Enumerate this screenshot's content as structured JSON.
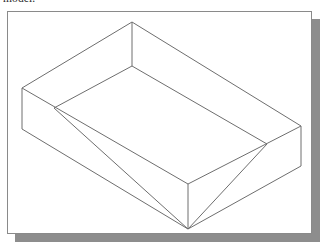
{
  "document": {
    "text_fragment": "model.",
    "background_color": "#ffffff"
  },
  "figure": {
    "name": "isometric-open-box-wireframe",
    "caption": "",
    "frame": {
      "border_color": "#8a8a8a",
      "fill_color": "#ffffff",
      "x": 7,
      "y": 11,
      "width": 305,
      "height": 223
    },
    "shadow": {
      "color": "#8d8d8d",
      "offset_x": 8,
      "offset_y": 8
    },
    "drawing": {
      "type": "isometric-wireframe",
      "subject": "open-top rectangular box (tray)",
      "stroke_color": "#6e6e6e",
      "stroke_width": 1,
      "fill": "none",
      "vertices": {
        "outer_top_back": [
          124,
          10
        ],
        "outer_top_left": [
          14,
          76
        ],
        "outer_top_front": [
          180,
          172
        ],
        "outer_top_right": [
          293,
          114
        ],
        "outer_bottom_left": [
          14,
          117
        ],
        "outer_bottom_front": [
          180,
          217
        ],
        "outer_bottom_right": [
          293,
          154
        ],
        "inner_top_back": [
          124,
          54
        ],
        "inner_rim_left": [
          46,
          96
        ],
        "inner_rim_right": [
          259,
          132
        ]
      },
      "edges": [
        {
          "name": "top-rim-back-left",
          "from": "outer_top_back",
          "to": "outer_top_left"
        },
        {
          "name": "top-rim-back-right",
          "from": "outer_top_back",
          "to": "outer_top_right"
        },
        {
          "name": "top-rim-front-left",
          "from": "outer_top_left",
          "to": "outer_top_front"
        },
        {
          "name": "top-rim-front-right",
          "from": "outer_top_front",
          "to": "outer_top_right"
        },
        {
          "name": "vertical-left",
          "from": "outer_top_left",
          "to": "outer_bottom_left"
        },
        {
          "name": "vertical-front",
          "from": "outer_top_front",
          "to": "outer_bottom_front"
        },
        {
          "name": "vertical-right",
          "from": "outer_top_right",
          "to": "outer_bottom_right"
        },
        {
          "name": "vertical-inner-back",
          "from": "outer_top_back",
          "to": "inner_top_back"
        },
        {
          "name": "bottom-edge-left",
          "from": "outer_bottom_left",
          "to": "outer_bottom_front"
        },
        {
          "name": "bottom-edge-right",
          "from": "outer_bottom_front",
          "to": "outer_bottom_right"
        },
        {
          "name": "inner-floor-back-left",
          "from": "inner_top_back",
          "to": "inner_rim_left"
        },
        {
          "name": "inner-floor-back-right",
          "from": "inner_top_back",
          "to": "inner_rim_right"
        },
        {
          "name": "inner-floor-front-left",
          "from": "inner_rim_left",
          "to": "outer_bottom_front"
        },
        {
          "name": "inner-floor-front-right",
          "from": "outer_bottom_front",
          "to": "inner_rim_right"
        }
      ]
    }
  }
}
